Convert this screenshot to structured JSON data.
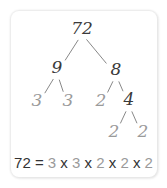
{
  "colors": {
    "composite": "#3a3a3a",
    "prime": "#9a9a9a",
    "edge": "#6a6a6a"
  },
  "tree": {
    "nodes": [
      {
        "id": "n72",
        "value": "72",
        "prime": false
      },
      {
        "id": "n9",
        "value": "9",
        "prime": false,
        "parent": "n72"
      },
      {
        "id": "n8",
        "value": "8",
        "prime": false,
        "parent": "n72"
      },
      {
        "id": "n3a",
        "value": "3",
        "prime": true,
        "parent": "n9"
      },
      {
        "id": "n3b",
        "value": "3",
        "prime": true,
        "parent": "n9"
      },
      {
        "id": "n2a",
        "value": "2",
        "prime": true,
        "parent": "n8"
      },
      {
        "id": "n4",
        "value": "4",
        "prime": false,
        "parent": "n8"
      },
      {
        "id": "n2b",
        "value": "2",
        "prime": true,
        "parent": "n4"
      },
      {
        "id": "n2c",
        "value": "2",
        "prime": true,
        "parent": "n4"
      }
    ]
  },
  "equation": {
    "lhs": "72",
    "equals": "=",
    "factors": [
      "3",
      "3",
      "2",
      "2",
      "2"
    ],
    "operator": "x"
  }
}
